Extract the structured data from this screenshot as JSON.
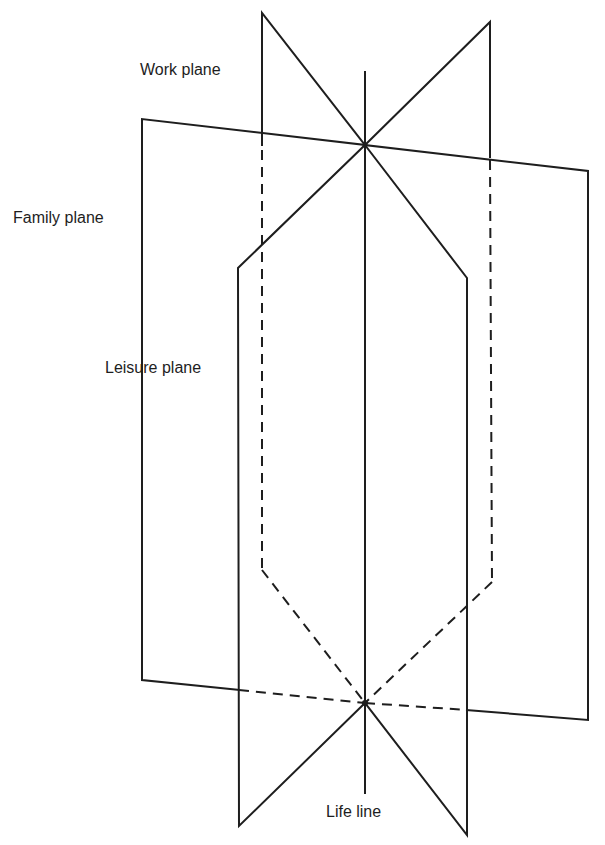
{
  "diagram": {
    "labels": {
      "work_plane": "Work plane",
      "family_plane": "Family plane",
      "leisure_plane": "Leisure plane",
      "life_line": "Life line"
    },
    "colors": {
      "line": "#1e1e1e",
      "background": "#ffffff"
    }
  }
}
